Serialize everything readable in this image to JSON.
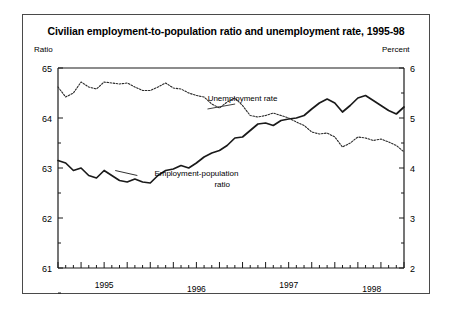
{
  "chart_data": {
    "type": "line",
    "title": "Civilian employment-to-population ratio and unemployment rate, 1995-98",
    "xlabel": "",
    "ylabel": "Ratio",
    "y2label": "Percent",
    "ylim": [
      61,
      65
    ],
    "y2lim": [
      2,
      6
    ],
    "yticks": [
      61,
      62,
      63,
      64,
      65
    ],
    "yticklabels": [
      "61",
      "62",
      "63",
      "64",
      "65"
    ],
    "y2ticks": [
      2,
      3,
      4,
      5,
      6
    ],
    "y2ticklabels": [
      "2",
      "3",
      "4",
      "5",
      "6"
    ],
    "grid": false,
    "legend_position": "inline-annotations",
    "x_tick_unit": "month",
    "xlim": [
      1995.0,
      1998.75
    ],
    "year_labels": [
      "1995",
      "1996",
      "1997",
      "1998"
    ],
    "year_label_x": [
      1995.5,
      1996.5,
      1997.5,
      1998.4
    ],
    "annotations": [
      {
        "text": "Unemployment rate",
        "x": 1997.0,
        "y": 5.35,
        "series": "Unemployment rate"
      },
      {
        "text": "Employment-population",
        "x": 1996.5,
        "y": 62.85,
        "series": "Employment-population ratio"
      },
      {
        "text": "ratio",
        "x": 1996.78,
        "y": 62.62,
        "series": "Employment-population ratio"
      }
    ],
    "series": [
      {
        "name": "Employment-population ratio",
        "axis": "left",
        "style": "solid",
        "color": "#1a1a1a",
        "x": [
          1995.0,
          1995.083,
          1995.167,
          1995.25,
          1995.333,
          1995.417,
          1995.5,
          1995.583,
          1995.667,
          1995.75,
          1995.833,
          1995.917,
          1996.0,
          1996.083,
          1996.167,
          1996.25,
          1996.333,
          1996.417,
          1996.5,
          1996.583,
          1996.667,
          1996.75,
          1996.833,
          1996.917,
          1997.0,
          1997.083,
          1997.167,
          1997.25,
          1997.333,
          1997.417,
          1997.5,
          1997.583,
          1997.667,
          1997.75,
          1997.833,
          1997.917,
          1998.0,
          1998.083,
          1998.167,
          1998.25,
          1998.333,
          1998.417,
          1998.5,
          1998.583,
          1998.667,
          1998.75
        ],
        "values": [
          63.15,
          63.1,
          62.95,
          63.0,
          62.85,
          62.8,
          62.95,
          62.85,
          62.75,
          62.72,
          62.78,
          62.72,
          62.7,
          62.85,
          62.95,
          62.98,
          63.05,
          63.0,
          63.1,
          63.22,
          63.3,
          63.35,
          63.45,
          63.6,
          63.62,
          63.75,
          63.88,
          63.9,
          63.85,
          63.95,
          63.98,
          64.0,
          64.05,
          64.18,
          64.3,
          64.38,
          64.3,
          64.12,
          64.25,
          64.4,
          64.45,
          64.35,
          64.25,
          64.15,
          64.08,
          64.22
        ]
      },
      {
        "name": "Unemployment rate",
        "axis": "right",
        "style": "dotted",
        "color": "#2a2a2a",
        "x": [
          1995.0,
          1995.083,
          1995.167,
          1995.25,
          1995.333,
          1995.417,
          1995.5,
          1995.583,
          1995.667,
          1995.75,
          1995.833,
          1995.917,
          1996.0,
          1996.083,
          1996.167,
          1996.25,
          1996.333,
          1996.417,
          1996.5,
          1996.583,
          1996.667,
          1996.75,
          1996.833,
          1996.917,
          1997.0,
          1997.083,
          1997.167,
          1997.25,
          1997.333,
          1997.417,
          1997.5,
          1997.583,
          1997.667,
          1997.75,
          1997.833,
          1997.917,
          1998.0,
          1998.083,
          1998.167,
          1998.25,
          1998.333,
          1998.417,
          1998.5,
          1998.583,
          1998.667,
          1998.75
        ],
        "values": [
          5.62,
          5.42,
          5.5,
          5.72,
          5.62,
          5.58,
          5.72,
          5.7,
          5.68,
          5.7,
          5.62,
          5.55,
          5.55,
          5.62,
          5.7,
          5.6,
          5.58,
          5.5,
          5.45,
          5.42,
          5.28,
          5.2,
          5.32,
          5.4,
          5.25,
          5.05,
          5.02,
          5.05,
          5.1,
          5.05,
          5.0,
          4.92,
          4.85,
          4.72,
          4.68,
          4.7,
          4.62,
          4.42,
          4.5,
          4.62,
          4.6,
          4.55,
          4.58,
          4.52,
          4.45,
          4.32
        ]
      }
    ]
  },
  "axes": {
    "left_title": "Ratio",
    "right_title": "Percent"
  }
}
